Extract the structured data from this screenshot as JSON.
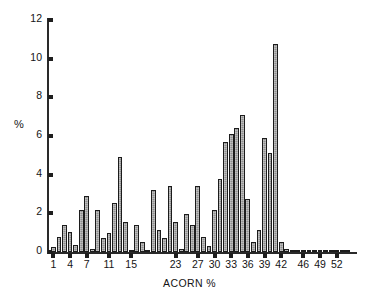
{
  "chart_data": {
    "type": "bar",
    "title": "",
    "subtitle": "",
    "xlabel": "ACORN %",
    "ylabel": "%",
    "grid": false,
    "legend": null,
    "ylim": [
      0,
      12
    ],
    "ytick_values": [
      0,
      2,
      4,
      6,
      8,
      10,
      12
    ],
    "ytick_labels": [
      "0",
      "2",
      "4",
      "6",
      "8",
      "10",
      "12"
    ],
    "xtick_labels": [
      "1",
      "4",
      "7",
      "11",
      "15",
      "23",
      "27",
      "30",
      "33",
      "36",
      "39",
      "42",
      "46",
      "49",
      "52"
    ],
    "xtick_categories": [
      1,
      4,
      7,
      11,
      15,
      23,
      27,
      30,
      33,
      36,
      39,
      42,
      46,
      49,
      52
    ],
    "categories": [
      1,
      2,
      3,
      4,
      5,
      6,
      7,
      8,
      9,
      10,
      11,
      12,
      13,
      14,
      15,
      16,
      17,
      18,
      19,
      20,
      21,
      22,
      23,
      24,
      25,
      26,
      27,
      28,
      29,
      30,
      31,
      32,
      33,
      34,
      35,
      36,
      37,
      38,
      39,
      40,
      41,
      42,
      43,
      44,
      45,
      46,
      47,
      48,
      49,
      50,
      51,
      52,
      53,
      54
    ],
    "values": [
      0.25,
      0.8,
      1.4,
      1.05,
      0.35,
      2.15,
      2.9,
      0.15,
      2.15,
      0.75,
      1.0,
      2.55,
      4.9,
      1.55,
      0.1,
      1.4,
      0.5,
      0.1,
      3.2,
      1.15,
      0.75,
      3.4,
      1.55,
      0.15,
      1.95,
      1.4,
      3.4,
      0.8,
      0.3,
      2.15,
      3.8,
      5.7,
      6.1,
      6.4,
      7.1,
      2.75,
      0.5,
      1.15,
      5.9,
      5.1,
      10.75,
      0.5,
      0.15,
      0,
      0,
      0,
      0,
      0,
      0,
      0,
      0,
      0,
      0,
      0
    ],
    "bar_color": "#8f8f8f",
    "bar_edge_color": "#1c1c1c",
    "axis_color": "#2a2a2a"
  },
  "axes": {
    "ylabel": "%",
    "xlabel": "ACORN %"
  }
}
